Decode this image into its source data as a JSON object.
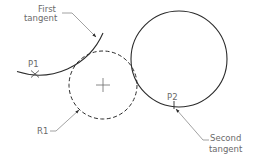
{
  "diagram": {
    "type": "cad-tangent-tangent-radius",
    "colors": {
      "line": "#2b2b2b",
      "leader": "#8a8a8a",
      "text": "#6a6a6a",
      "background": "#ffffff"
    },
    "labels": {
      "first_tangent_line1": "First",
      "first_tangent_line2": "tangent",
      "second_tangent_line1": "Second",
      "second_tangent_line2": "tangent",
      "p1": "P1",
      "p2": "P2",
      "r1": "R1"
    },
    "shapes": {
      "first_arc": {
        "style": "solid",
        "description": "arc tangent to dashed circle"
      },
      "second_circle": {
        "style": "solid",
        "cx": 179,
        "cy": 59,
        "r": 48
      },
      "tangent_circle": {
        "style": "dashed",
        "cx": 103,
        "cy": 85,
        "r": 34,
        "center_mark": "+"
      },
      "p1_marker": "x",
      "p2_marker": "tick"
    }
  }
}
